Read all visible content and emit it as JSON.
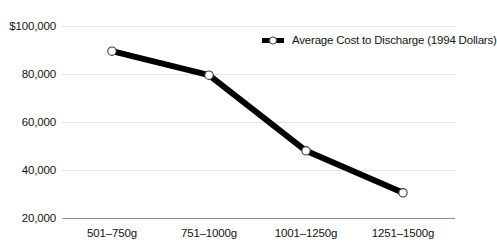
{
  "chart_data": {
    "type": "line",
    "title": "",
    "xlabel": "",
    "ylabel": "",
    "categories": [
      "501–750g",
      "751–1000g",
      "1001–1250g",
      "1251–1500g"
    ],
    "series": [
      {
        "name": "Average Cost to Discharge (1994 Dollars)",
        "values": [
          89500,
          79500,
          48000,
          30500
        ]
      }
    ],
    "ylim": [
      20000,
      100000
    ],
    "yticks": [
      20000,
      40000,
      60000,
      80000,
      100000
    ],
    "ytick_labels": [
      "20,000",
      "40,000",
      "60,000",
      "80,000",
      "$100,000"
    ],
    "grid": true,
    "legend_position": "top-right",
    "colors": {
      "line": "#000000",
      "marker_fill": "#ffffff",
      "marker_stroke": "#3a3a3a",
      "gridline": "#e3e3e3",
      "axis": "#8d8d8d",
      "text": "#131313",
      "background": "#ffffff"
    }
  },
  "legend": {
    "label": "Average Cost to Discharge (1994 Dollars)",
    "symbol": "line-with-circle-marker"
  },
  "axes": {
    "y_labels": [
      "$100,000",
      "80,000",
      "60,000",
      "40,000",
      "20,000"
    ],
    "x_labels": [
      "501–750g",
      "751–1000g",
      "1001–1250g",
      "1251–1500g"
    ]
  }
}
